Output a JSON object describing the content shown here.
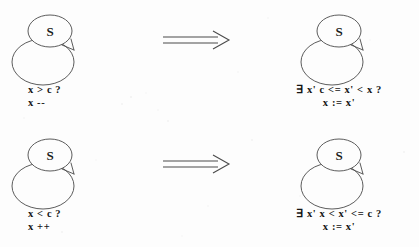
{
  "figure": {
    "background_color": "#fdfdfd",
    "stroke_color": "#4a4a4a",
    "text_color": "#151515"
  },
  "rules": [
    {
      "id": "rule-decrement",
      "lhs": {
        "state_label": "S",
        "guard": "x > c ?",
        "action": "x --"
      },
      "operator": "⟹",
      "operator_name": "implies",
      "rhs": {
        "state_label": "S",
        "guard": "∃ x'  c <= x' < x ?",
        "action": "x := x'"
      }
    },
    {
      "id": "rule-increment",
      "lhs": {
        "state_label": "S",
        "guard": "x < c ?",
        "action": "x ++"
      },
      "operator": "⟹",
      "operator_name": "implies",
      "rhs": {
        "state_label": "S",
        "guard": "∃ x'  x < x' <= c ?",
        "action": "x := x'"
      }
    }
  ]
}
